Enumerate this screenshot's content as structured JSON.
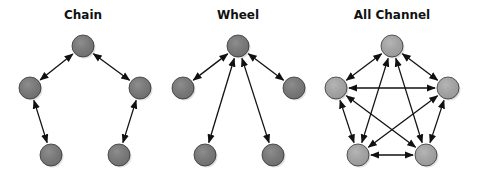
{
  "diagrams": [
    {
      "title": "Chain",
      "node_color": "#7a7a7a",
      "nodes": [
        [
          83,
          46
        ],
        [
          30,
          88
        ],
        [
          140,
          88
        ],
        [
          51,
          155
        ],
        [
          119,
          155
        ]
      ],
      "edges": [
        [
          0,
          1
        ],
        [
          0,
          2
        ],
        [
          1,
          3
        ],
        [
          2,
          4
        ]
      ]
    },
    {
      "title": "Wheel",
      "node_color": "#7a7a7a",
      "nodes": [
        [
          238,
          46
        ],
        [
          183,
          88
        ],
        [
          294,
          88
        ],
        [
          205,
          155
        ],
        [
          273,
          155
        ]
      ],
      "edges": [
        [
          0,
          1
        ],
        [
          0,
          2
        ],
        [
          0,
          3
        ],
        [
          0,
          4
        ]
      ]
    },
    {
      "title": "All Channel",
      "node_color": "#a9a9a9",
      "nodes": [
        [
          392,
          46
        ],
        [
          336,
          88
        ],
        [
          448,
          88
        ],
        [
          358,
          155
        ],
        [
          426,
          155
        ]
      ],
      "edges": [
        [
          0,
          1
        ],
        [
          0,
          2
        ],
        [
          0,
          3
        ],
        [
          0,
          4
        ],
        [
          1,
          2
        ],
        [
          1,
          3
        ],
        [
          1,
          4
        ],
        [
          2,
          3
        ],
        [
          2,
          4
        ],
        [
          3,
          4
        ]
      ]
    }
  ]
}
